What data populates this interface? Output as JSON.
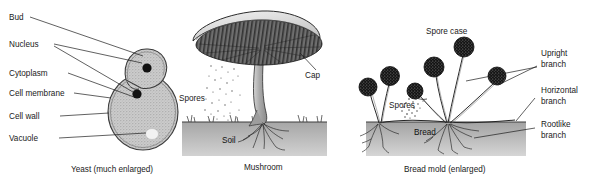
{
  "figure": {
    "background_color": "#ffffff",
    "ink_color": "#1a1a1a"
  },
  "panels": [
    {
      "id": "yeast",
      "caption": "Yeast (much enlarged)",
      "labels": [
        {
          "id": "bud",
          "text": "Bud"
        },
        {
          "id": "nucleus",
          "text": "Nucleus"
        },
        {
          "id": "cytoplasm",
          "text": "Cytoplasm"
        },
        {
          "id": "cell-membrane",
          "text": "Cell membrane"
        },
        {
          "id": "cell-wall",
          "text": "Cell  wall"
        },
        {
          "id": "vacuole",
          "text": "Vacuole"
        }
      ]
    },
    {
      "id": "mushroom",
      "caption": "Mushroom",
      "labels": [
        {
          "id": "cap",
          "text": "Cap"
        },
        {
          "id": "spores",
          "text": "Spores"
        },
        {
          "id": "soil",
          "text": "Soil"
        }
      ]
    },
    {
      "id": "bread-mold",
      "caption": "Bread mold (enlarged)",
      "labels": [
        {
          "id": "spore-case",
          "text": "Spore case"
        },
        {
          "id": "spores",
          "text": "Spores"
        },
        {
          "id": "bread",
          "text": "Bread"
        },
        {
          "id": "upright-branch-line1",
          "text": "Upright"
        },
        {
          "id": "upright-branch-line2",
          "text": "branch"
        },
        {
          "id": "horizontal-branch-line1",
          "text": "Horizontal"
        },
        {
          "id": "horizontal-branch-line2",
          "text": "branch"
        },
        {
          "id": "rootlike-branch-line1",
          "text": "Rootlike"
        },
        {
          "id": "rootlike-branch-line2",
          "text": "branch"
        }
      ]
    }
  ],
  "colors": {
    "cell_fill": "#c9c9c9",
    "nucleus": "#111111",
    "vacuole": "#efefef",
    "cap_top": "#d8d8d8",
    "gills": "#5a5a5a",
    "stalk": "#b0b0b0",
    "soil": "#9a9a9a",
    "bread": "#a8a8a8",
    "sporangium": "#161616",
    "outline": "#2a2a2a"
  }
}
